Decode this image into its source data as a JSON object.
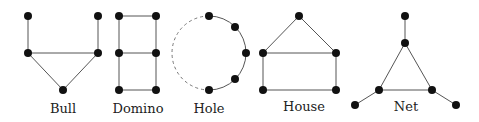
{
  "graphs": [
    {
      "name": "Bull",
      "label": "Bull"
    },
    {
      "name": "Domino",
      "label": "Domino"
    },
    {
      "name": "Hole",
      "label": "Hole"
    },
    {
      "name": "House",
      "label": "House"
    },
    {
      "name": "Net",
      "label": "Net"
    }
  ],
  "colors": {
    "node": "#111111",
    "edge": "#555555",
    "dashed_edge": "#777777"
  }
}
